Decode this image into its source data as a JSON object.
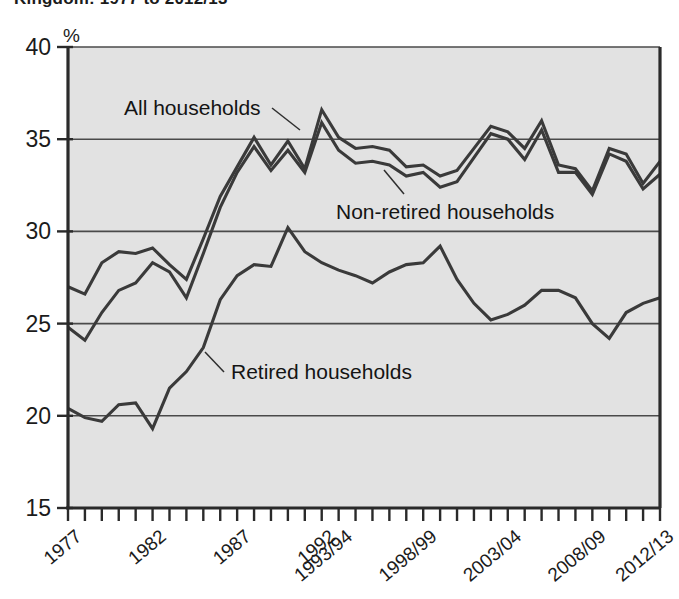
{
  "title": "Kingdom: 1977 to 2012/13",
  "chart_data": {
    "type": "line",
    "title": "Kingdom: 1977 to 2012/13",
    "xlabel": "",
    "ylabel": "%",
    "ylim": [
      15,
      40
    ],
    "yticks": [
      15,
      20,
      25,
      30,
      35,
      40
    ],
    "ytick_labels": [
      "15",
      "20",
      "25",
      "30",
      "35",
      "40"
    ],
    "grid": "horizontal",
    "legend_position": "inline-annotations",
    "x": [
      "1977",
      "1978",
      "1979",
      "1980",
      "1981",
      "1982",
      "1983",
      "1984",
      "1985",
      "1986",
      "1987",
      "1988",
      "1989",
      "1990",
      "1991",
      "1992",
      "1993/94",
      "1994/95",
      "1995/96",
      "1996/97",
      "1997/98",
      "1998/99",
      "1999/00",
      "2000/01",
      "2001/02",
      "2002/03",
      "2003/04",
      "2004/05",
      "2005/06",
      "2006/07",
      "2007/08",
      "2008/09",
      "2009/10",
      "2010/11",
      "2011/12",
      "2012/13"
    ],
    "xtick_labels_shown": [
      "1977",
      "1982",
      "1987",
      "1992",
      "1993/94",
      "1998/99",
      "2003/04",
      "2008/09",
      "2012/13"
    ],
    "series": [
      {
        "name": "All households",
        "label": "All households",
        "color": "#3a3a3a",
        "values": [
          27.0,
          26.6,
          28.3,
          28.9,
          28.8,
          29.1,
          28.2,
          27.4,
          29.6,
          31.9,
          33.5,
          35.1,
          33.6,
          34.9,
          33.4,
          36.6,
          35.1,
          34.5,
          34.6,
          34.4,
          33.5,
          33.6,
          33.0,
          33.3,
          34.5,
          35.7,
          35.4,
          34.5,
          36.0,
          33.6,
          33.4,
          32.2,
          34.5,
          34.2,
          32.6,
          33.8
        ]
      },
      {
        "name": "Non-retired households",
        "label": "Non-retired households",
        "color": "#3a3a3a",
        "values": [
          24.8,
          24.1,
          25.6,
          26.8,
          27.2,
          28.3,
          27.8,
          26.4,
          28.8,
          31.3,
          33.2,
          34.6,
          33.3,
          34.4,
          33.2,
          35.9,
          34.4,
          33.7,
          33.8,
          33.6,
          33.0,
          33.2,
          32.4,
          32.7,
          34.0,
          35.3,
          35.0,
          33.9,
          35.5,
          33.2,
          33.2,
          32.0,
          34.2,
          33.8,
          32.3,
          33.1
        ]
      },
      {
        "name": "Retired households",
        "label": "Retired households",
        "color": "#3a3a3a",
        "values": [
          20.4,
          19.9,
          19.7,
          20.6,
          20.7,
          19.3,
          21.5,
          22.4,
          23.7,
          26.3,
          27.6,
          28.2,
          28.1,
          30.2,
          28.9,
          28.3,
          27.9,
          27.6,
          27.2,
          27.8,
          28.2,
          28.3,
          29.2,
          27.4,
          26.1,
          25.2,
          25.5,
          26.0,
          26.8,
          26.8,
          26.4,
          25.0,
          24.2,
          25.6,
          26.1,
          26.4
        ]
      }
    ]
  },
  "axis": {
    "y_unit_label": "%",
    "y_labels": [
      "40",
      "35",
      "30",
      "25",
      "20",
      "15"
    ],
    "x_labels": [
      "1977",
      "1982",
      "1987",
      "1992",
      "1993/94",
      "1998/99",
      "2003/04",
      "2008/09",
      "2012/13"
    ]
  },
  "annotations": [
    {
      "name": "all-households",
      "text": "All households"
    },
    {
      "name": "non-retired-households",
      "text": "Non-retired households"
    },
    {
      "name": "retired-households",
      "text": "Retired households"
    }
  ]
}
